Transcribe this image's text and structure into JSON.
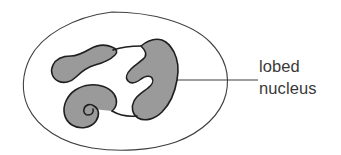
{
  "figure": {
    "background_color": "#ffffff"
  },
  "diagram": {
    "type": "biological-cell-diagram",
    "cell": {
      "name": "cell-membrane-outline",
      "fill_color": "#ffffff",
      "stroke_color": "#3f3f3f",
      "stroke_width": 1.1,
      "shape": "rounded-irregular-oval",
      "bounds": {
        "x": 24,
        "y": 12,
        "width": 204,
        "height": 138
      }
    },
    "nucleus": {
      "name": "lobed-nucleus",
      "fill_color": "#9a9a9a",
      "stroke_color": "#1f1f1f",
      "stroke_width": 1.6,
      "lobe_count": 3,
      "description": "three gray lobes joined by thin chromatin bridges",
      "bounds": {
        "x": 52,
        "y": 38,
        "width": 126,
        "height": 90
      }
    },
    "leader_line": {
      "name": "leader-line",
      "color": "#3f3f3f",
      "width": 1.1,
      "from": {
        "x": 171,
        "y": 80
      },
      "to": {
        "x": 258,
        "y": 80
      }
    }
  },
  "labels": {
    "nucleus_label": {
      "line1": "lobed",
      "line2": "nucleus",
      "color": "#3a3a3a",
      "x": 259,
      "y": 56
    }
  }
}
